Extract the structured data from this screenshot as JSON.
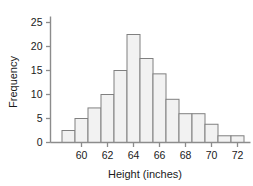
{
  "chart_data": {
    "type": "bar",
    "title": "",
    "subtitle": "",
    "xlabel": "Height (inches)",
    "ylabel": "Frequency",
    "categories": [
      "58.5-59.5",
      "59.5-60.5",
      "60.5-61.5",
      "61.5-62.5",
      "62.5-63.5",
      "63.5-64.5",
      "64.5-65.5",
      "65.5-66.5",
      "66.5-67.5",
      "67.5-68.5",
      "68.5-69.5",
      "69.5-70.5",
      "70.5-71.5",
      "71.5-72.5"
    ],
    "bin_edges": [
      58.5,
      59.5,
      60.5,
      61.5,
      62.5,
      63.5,
      64.5,
      65.5,
      66.5,
      67.5,
      68.5,
      69.5,
      70.5,
      71.5,
      72.5
    ],
    "bin_centers": [
      59,
      60,
      61,
      62,
      63,
      64,
      65,
      66,
      67,
      68,
      69,
      70,
      71,
      72
    ],
    "values": [
      2.5,
      5,
      7.2,
      10,
      15,
      22.5,
      17.5,
      14.3,
      9,
      6,
      6,
      3.8,
      1.4,
      1.4
    ],
    "bin_width": 1,
    "xlim": [
      58.5,
      73.0
    ],
    "ylim": [
      0,
      27
    ],
    "xticks": [
      60,
      62,
      64,
      66,
      68,
      70,
      72
    ],
    "xtick_labels": [
      "60",
      "62",
      "64",
      "66",
      "68",
      "70",
      "72"
    ],
    "yticks": [
      0,
      5,
      10,
      15,
      20,
      25
    ],
    "ytick_labels": [
      "0",
      "5",
      "10",
      "15",
      "20",
      "25"
    ],
    "grid": false,
    "legend": null,
    "legend_position": "none",
    "bar_fill_color": "#f2f2f2",
    "bar_edge_color": "#808080",
    "axis_color": "#8c8c8c",
    "text_color": "#1a1a1a",
    "background_color": "#ffffff"
  }
}
